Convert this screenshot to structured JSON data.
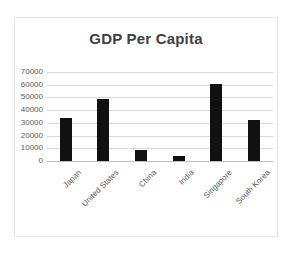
{
  "chart_data": {
    "type": "bar",
    "title": "GDP Per Capita",
    "xlabel": "",
    "ylabel": "",
    "categories": [
      "Japan",
      "United States",
      "China",
      "India",
      "Singapore",
      "South Korea"
    ],
    "values": [
      34000,
      48500,
      9000,
      4000,
      60500,
      32000
    ],
    "ytick_labels": [
      "70000",
      "60000",
      "50000",
      "40000",
      "30000",
      "20000",
      "10000",
      "0"
    ],
    "ytick_values": [
      70000,
      60000,
      50000,
      40000,
      30000,
      20000,
      10000,
      0
    ],
    "ylim": [
      0,
      70000
    ],
    "grid": true,
    "legend": false,
    "bar_color": "#111111",
    "gridline_color": "#d9d9d9",
    "text_color": "#595959",
    "title_color": "#404040",
    "border_color": "#e6e6e6",
    "background": "#ffffff"
  }
}
